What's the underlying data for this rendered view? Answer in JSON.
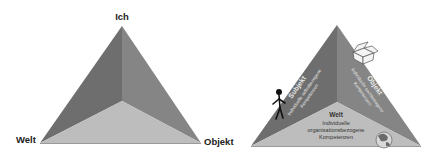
{
  "left_diagram": {
    "labels": {
      "top": "Ich",
      "left": "Welt",
      "right": "Objekt"
    },
    "colors": {
      "left_face": "#6e6e6e",
      "right_face": "#858585",
      "bottom_face": "#bdbdbd"
    }
  },
  "right_diagram": {
    "subjekt": {
      "title": "Subjekt",
      "line1": "Individuelle selbstbezogene",
      "line2": "Kompetenzen"
    },
    "objekt": {
      "title": "Objekt",
      "line1": "Individuelle sachbezogene",
      "line2": "Kompetenzen"
    },
    "welt": {
      "title": "Welt",
      "line1": "Individuelle",
      "line2": "organisationsbezogene",
      "line3": "Kompetenzen"
    },
    "icons": [
      "person-icon",
      "box-icon",
      "globe-icon"
    ],
    "colors": {
      "left_face": "#6e6e6e",
      "right_face": "#858585",
      "bottom_face": "#bdbdbd"
    }
  }
}
